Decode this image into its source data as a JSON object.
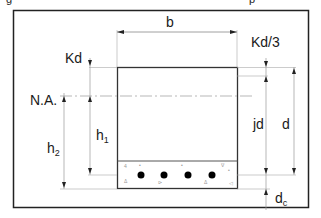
{
  "title_fragment": "g",
  "title_fragment_2": "p",
  "diagram": {
    "type": "reinforced-concrete-beam-cross-section",
    "labels": {
      "width": "b",
      "kd": "Kd",
      "kd_third": "Kd/3",
      "neutral_axis": "N.A.",
      "h1": "h",
      "h1_sub": "1",
      "h2": "h",
      "h2_sub": "2",
      "jd": "jd",
      "d": "d",
      "dc": "d",
      "dc_sub": "c"
    },
    "rebar_count": 4,
    "colors": {
      "frame": "#222222",
      "beam_outline": "#333333",
      "dimension_lines": "#888888",
      "rebar": "#000000"
    }
  }
}
